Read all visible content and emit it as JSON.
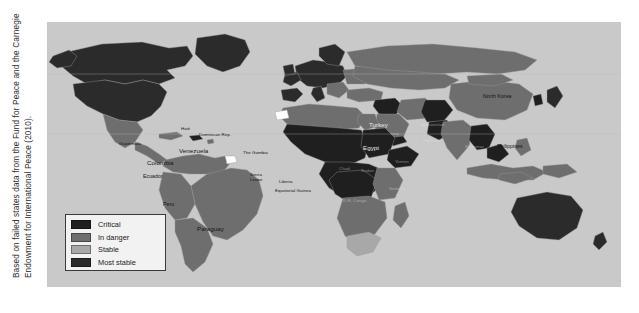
{
  "figure": {
    "caption_line1": "Based on failed states data from the Fund for Peace and the Carnegie",
    "caption_line2": "Endowment for International Peace (2010)."
  },
  "map": {
    "background_color": "#c9c9c9",
    "ocean_color": "#c9c9c9",
    "border_color": "#8f8f8f"
  },
  "legend": {
    "title": "",
    "items": [
      {
        "label": "Critical",
        "color": "#1f1f1f"
      },
      {
        "label": "In danger",
        "color": "#6e6e6e"
      },
      {
        "label": "Stable",
        "color": "#a8a8a8"
      },
      {
        "label": "Most stable",
        "color": "#2b2b2b"
      }
    ]
  },
  "labels": [
    {
      "name": "guatemala",
      "text": "Guatemala",
      "x": 88,
      "y": 122
    },
    {
      "name": "haiti",
      "text": "Haiti",
      "x": 139,
      "y": 107
    },
    {
      "name": "dominican-rep",
      "text": "Dominican Rep.",
      "x": 153,
      "y": 113
    },
    {
      "name": "colombia",
      "text": "Colombia",
      "x": 112,
      "y": 142
    },
    {
      "name": "venezuela",
      "text": "Venezuela",
      "x": 140,
      "y": 131
    },
    {
      "name": "ecuador",
      "text": "Ecuador",
      "x": 105,
      "y": 158
    },
    {
      "name": "peru",
      "text": "Peru",
      "x": 122,
      "y": 185
    },
    {
      "name": "paraguay",
      "text": "Paraguay",
      "x": 158,
      "y": 209
    },
    {
      "name": "the-gambia",
      "text": "The Gambia",
      "x": 204,
      "y": 131
    },
    {
      "name": "sierra-leone",
      "text": "Sierra Leone",
      "x": 214,
      "y": 155
    },
    {
      "name": "liberia",
      "text": "Liberia",
      "x": 239,
      "y": 160
    },
    {
      "name": "equatorial-guinea",
      "text": "Equatorial Guinea",
      "x": 240,
      "y": 170
    },
    {
      "name": "turkey",
      "text": "Turkey",
      "x": 328,
      "y": 104
    },
    {
      "name": "egypt",
      "text": "Egypt",
      "x": 322,
      "y": 127
    },
    {
      "name": "north-korea",
      "text": "North Korea",
      "x": 443,
      "y": 76
    },
    {
      "name": "philippines",
      "text": "Philippines",
      "x": 458,
      "y": 126
    }
  ],
  "region_labels_dark": [
    {
      "name": "sudan",
      "text": "Sudan",
      "x": 320,
      "y": 150
    },
    {
      "name": "chad",
      "text": "Chad",
      "x": 300,
      "y": 148
    },
    {
      "name": "somalia",
      "text": "Somalia",
      "x": 348,
      "y": 168
    },
    {
      "name": "dr-congo",
      "text": "D.R. Congo",
      "x": 307,
      "y": 180
    },
    {
      "name": "afghanistan",
      "text": "Afghanistan",
      "x": 383,
      "y": 104
    },
    {
      "name": "iraq",
      "text": "Iraq",
      "x": 349,
      "y": 113
    },
    {
      "name": "pakistan",
      "text": "Pakistan",
      "x": 380,
      "y": 120
    },
    {
      "name": "yemen",
      "text": "Yemen",
      "x": 356,
      "y": 141
    },
    {
      "name": "myanmar",
      "text": "Myanmar",
      "x": 424,
      "y": 126
    }
  ]
}
